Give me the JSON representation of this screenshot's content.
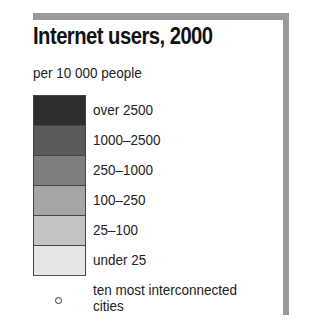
{
  "chart_data": {
    "type": "legend",
    "title": "Internet users, 2000",
    "subtitle": "per 10 000 people",
    "categories": [
      "over 2500",
      "1000–2500",
      "250–1000",
      "100–250",
      "25–100",
      "under 25"
    ],
    "colors": [
      "#2e2e2e",
      "#5a5a5a",
      "#7e7e7e",
      "#a5a5a5",
      "#c4c4c4",
      "#e6e6e6"
    ],
    "symbol": {
      "shape": "open-circle",
      "label_line1": "ten most interconnected",
      "label_line2": "cities"
    }
  },
  "legend": {
    "title": "Internet users, 2000",
    "subtitle": "per 10 000 people",
    "items": [
      {
        "label": "over 2500",
        "color": "#2e2e2e"
      },
      {
        "label": "1000–2500",
        "color": "#5a5a5a"
      },
      {
        "label": "250–1000",
        "color": "#7e7e7e"
      },
      {
        "label": "100–250",
        "color": "#a5a5a5"
      },
      {
        "label": "25–100",
        "color": "#c4c4c4"
      },
      {
        "label": "under 25",
        "color": "#e6e6e6"
      }
    ],
    "city": {
      "line1": "ten most interconnected",
      "line2": "cities"
    }
  }
}
